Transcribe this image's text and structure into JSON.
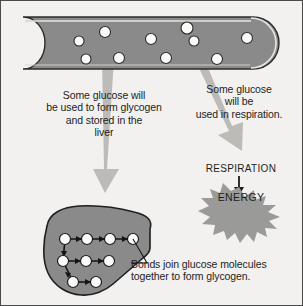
{
  "figure": {
    "background_color": "#f2f1ef",
    "border_color": "#4a4a4a"
  },
  "colors": {
    "vessel_fill": "#8a8a8a",
    "vessel_outline": "#2b2b2b",
    "glucose_fill": "#fbfbf9",
    "glucose_outline": "#2b2b2b",
    "arrow_fill": "#b9b8b4",
    "liver_fill": "#8a8a8a",
    "liver_outline": "#1f1f1f",
    "energy_fill": "#9a9a98",
    "text_color": "#1d1d1d",
    "bond_color": "#151515"
  },
  "blood_vessel": {
    "name": "blood vessel containing glucose",
    "glucose_count": 10,
    "glucose_positions": [
      {
        "cx": 78,
        "cy": 40,
        "r": 5
      },
      {
        "cx": 104,
        "cy": 31,
        "r": 5.5
      },
      {
        "cx": 85,
        "cy": 58,
        "r": 5
      },
      {
        "cx": 118,
        "cy": 57,
        "r": 5.5
      },
      {
        "cx": 150,
        "cy": 38,
        "r": 5.5
      },
      {
        "cx": 165,
        "cy": 57,
        "r": 5.5
      },
      {
        "cx": 186,
        "cy": 27,
        "r": 6
      },
      {
        "cx": 193,
        "cy": 40,
        "r": 5
      },
      {
        "cx": 216,
        "cy": 58,
        "r": 5.5
      },
      {
        "cx": 246,
        "cy": 37,
        "r": 5.5
      }
    ]
  },
  "arrows": {
    "to_liver": {
      "name": "arrow to liver",
      "direction": "down"
    },
    "to_respiration": {
      "name": "arrow to respiration",
      "direction": "down-right diagonal"
    },
    "respiration_to_energy": {
      "name": "small arrow respiration to energy",
      "direction": "down"
    }
  },
  "labels": {
    "glycogen": "Some glucose will\nbe used to form glycogen\nand stored in the\nliver",
    "respiration": "Some glucose\nwill be\nused in respiration.",
    "respiration_heading": "RESPIRATION",
    "energy": "ENERGY"
  },
  "liver": {
    "name": "liver with glycogen molecule",
    "glycogen_rows": [
      {
        "row": "top",
        "units": 4
      },
      {
        "row": "middle",
        "units": 3
      },
      {
        "row": "bottom",
        "units": 2
      }
    ],
    "glucose_unit_positions": [
      {
        "cx": 64,
        "cy": 238,
        "r": 5.5
      },
      {
        "cx": 86,
        "cy": 238,
        "r": 5.5
      },
      {
        "cx": 109,
        "cy": 238,
        "r": 5.5
      },
      {
        "cx": 132,
        "cy": 238,
        "r": 5.5
      },
      {
        "cx": 62,
        "cy": 260,
        "r": 5.5
      },
      {
        "cx": 85,
        "cy": 260,
        "r": 5.5
      },
      {
        "cx": 108,
        "cy": 260,
        "r": 5.5
      },
      {
        "cx": 72,
        "cy": 281,
        "r": 5.5
      },
      {
        "cx": 95,
        "cy": 281,
        "r": 5.5
      }
    ]
  },
  "caption": {
    "bonds": "Bonds join glucose molecules\ntogether to form glycogen."
  }
}
